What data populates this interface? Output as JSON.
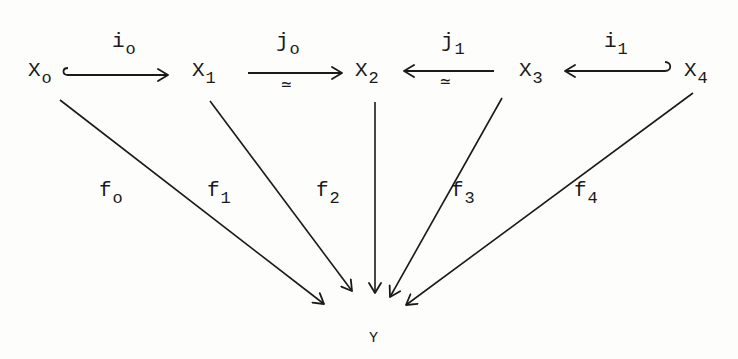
{
  "diagram": {
    "type": "commutative-diagram",
    "nodes": {
      "x0": {
        "main": "X",
        "sub": "o"
      },
      "x1": {
        "main": "X",
        "sub": "1"
      },
      "x2": {
        "main": "X",
        "sub": "2"
      },
      "x3": {
        "main": "X",
        "sub": "3"
      },
      "x4": {
        "main": "X",
        "sub": "4"
      },
      "y": {
        "main": "Y"
      }
    },
    "horizontal_arrows": {
      "i0": {
        "from": "X_o",
        "to": "X_1",
        "label_main": "i",
        "label_sub": "o",
        "style": "hook-inclusion",
        "iso": ""
      },
      "j0": {
        "from": "X_1",
        "to": "X_2",
        "label_main": "j",
        "label_sub": "o",
        "style": "plain",
        "iso": "≃"
      },
      "j1": {
        "from": "X_3",
        "to": "X_2",
        "label_main": "j",
        "label_sub": "1",
        "style": "plain",
        "iso": "≃"
      },
      "i1": {
        "from": "X_4",
        "to": "X_3",
        "label_main": "i",
        "label_sub": "1",
        "style": "hook-inclusion",
        "iso": ""
      }
    },
    "maps_to_y": {
      "f0": {
        "from": "X_o",
        "to": "Y",
        "label_main": "f",
        "label_sub": "o"
      },
      "f1": {
        "from": "X_1",
        "to": "Y",
        "label_main": "f",
        "label_sub": "1"
      },
      "f2": {
        "from": "X_2",
        "to": "Y",
        "label_main": "f",
        "label_sub": "2"
      },
      "f3": {
        "from": "X_3",
        "to": "Y",
        "label_main": "f",
        "label_sub": "3"
      },
      "f4": {
        "from": "X_4",
        "to": "Y",
        "label_main": "f",
        "label_sub": "4"
      }
    },
    "colors": {
      "ink": "#1a1a1a",
      "paper": "#fdfdfc"
    }
  }
}
